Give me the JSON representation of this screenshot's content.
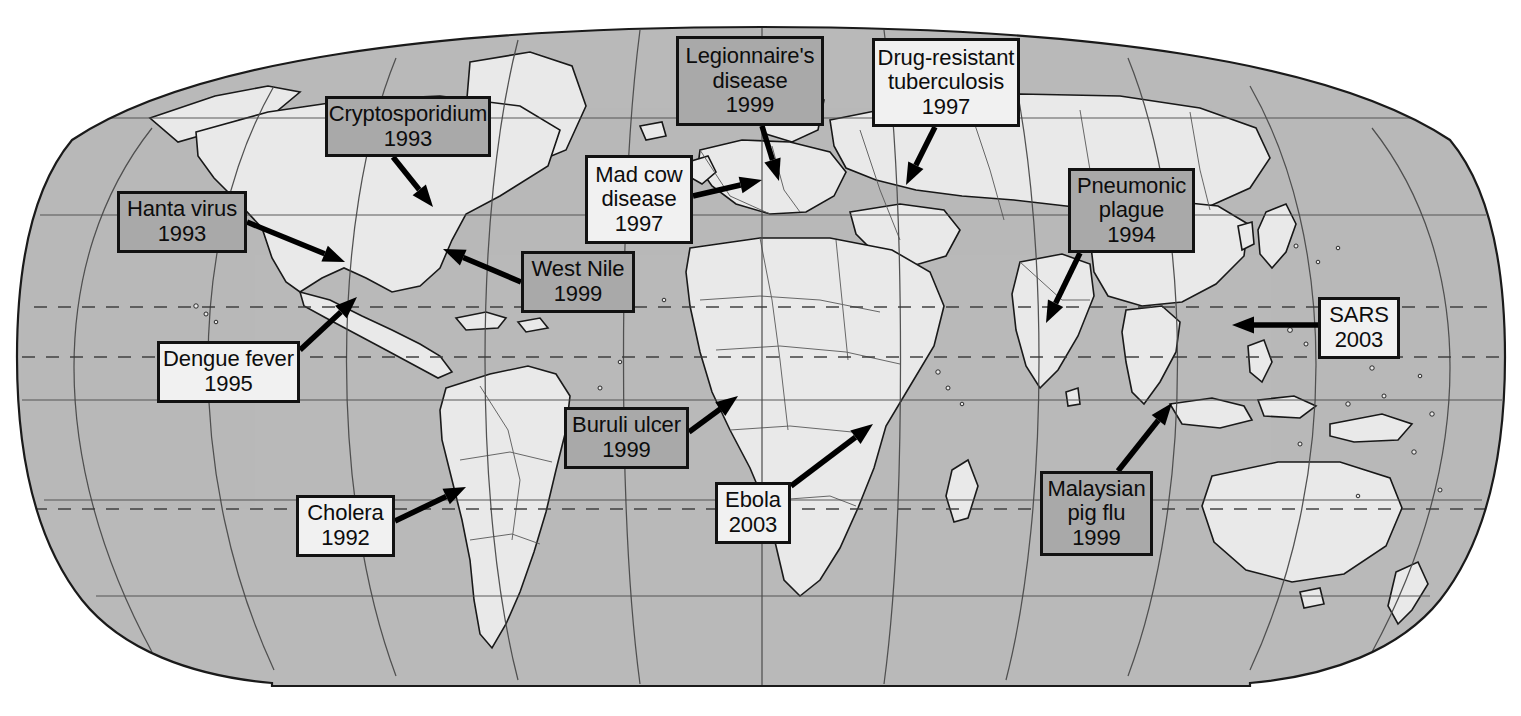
{
  "figure": {
    "kind": "world-map",
    "projection": "robinson-elliptical"
  },
  "colors": {
    "ocean": "#b9b9b9",
    "land": "#e9e9e9",
    "graticule": "#4a4a4a",
    "coastline": "#1a1a1a",
    "border": "#3a3a3a",
    "label_shaded": "#a9a9a9",
    "label_plain": "#f1f1f1",
    "label_outline": "#121212",
    "arrow": "#000000",
    "page_background": "#ffffff"
  },
  "map_frame": {
    "left": 20,
    "top": 27,
    "right": 1505,
    "bottom": 686,
    "dashed_latitudes": [
      "Tropic of Cancer",
      "Equator",
      "Tropic of Capricorn"
    ]
  },
  "labels": [
    {
      "id": "hanta-virus",
      "name": "Hanta virus",
      "year": "1993",
      "style": "shaded",
      "box": {
        "x": 117,
        "y": 191,
        "w": 130,
        "h": 62,
        "font": 22
      },
      "arrow": {
        "x1": 247,
        "y1": 222,
        "x2": 345,
        "y2": 262
      }
    },
    {
      "id": "cryptosporidium",
      "name": "Cryptosporidium",
      "year": "1993",
      "style": "shaded",
      "box": {
        "x": 325,
        "y": 96,
        "w": 166,
        "h": 61,
        "font": 22
      },
      "arrow": {
        "x1": 393,
        "y1": 157,
        "x2": 433,
        "y2": 207
      }
    },
    {
      "id": "dengue-fever",
      "name": "Dengue fever",
      "year": "1995",
      "style": "plain",
      "box": {
        "x": 157,
        "y": 341,
        "w": 143,
        "h": 62,
        "font": 22
      },
      "arrow": {
        "x1": 300,
        "y1": 350,
        "x2": 357,
        "y2": 297
      }
    },
    {
      "id": "west-nile",
      "name": "West Nile",
      "year": "1999",
      "style": "shaded",
      "box": {
        "x": 521,
        "y": 251,
        "w": 114,
        "h": 62,
        "font": 22
      },
      "arrow": {
        "x1": 521,
        "y1": 282,
        "x2": 443,
        "y2": 249
      }
    },
    {
      "id": "cholera",
      "name": "Cholera",
      "year": "1992",
      "style": "plain",
      "box": {
        "x": 296,
        "y": 495,
        "w": 99,
        "h": 62,
        "font": 22
      },
      "arrow": {
        "x1": 395,
        "y1": 521,
        "x2": 466,
        "y2": 487
      }
    },
    {
      "id": "mad-cow-disease",
      "name": "Mad cow disease",
      "year": "1997",
      "style": "plain",
      "box": {
        "x": 585,
        "y": 155,
        "w": 108,
        "h": 89,
        "font": 22
      },
      "arrow": {
        "x1": 693,
        "y1": 196,
        "x2": 762,
        "y2": 180
      }
    },
    {
      "id": "legionnaires-disease",
      "name": "Legionnaire's disease",
      "year": "1999",
      "style": "shaded",
      "box": {
        "x": 676,
        "y": 36,
        "w": 148,
        "h": 90,
        "font": 22
      },
      "arrow": {
        "x1": 762,
        "y1": 126,
        "x2": 779,
        "y2": 181
      }
    },
    {
      "id": "drug-resistant-tuberculosis",
      "name": "Drug-resistant tuberculosis",
      "year": "1997",
      "style": "plain",
      "box": {
        "x": 872,
        "y": 38,
        "w": 148,
        "h": 89,
        "font": 22
      },
      "arrow": {
        "x1": 935,
        "y1": 127,
        "x2": 906,
        "y2": 185
      }
    },
    {
      "id": "buruli-ulcer",
      "name": "Buruli ulcer",
      "year": "1999",
      "style": "shaded",
      "box": {
        "x": 564,
        "y": 407,
        "w": 125,
        "h": 62,
        "font": 22
      },
      "arrow": {
        "x1": 689,
        "y1": 432,
        "x2": 738,
        "y2": 396
      }
    },
    {
      "id": "ebola",
      "name": "Ebola",
      "year": "2003",
      "style": "plain",
      "box": {
        "x": 715,
        "y": 482,
        "w": 76,
        "h": 62,
        "font": 22
      },
      "arrow": {
        "x1": 791,
        "y1": 486,
        "x2": 873,
        "y2": 424
      }
    },
    {
      "id": "pneumonic-plague",
      "name": "Pneumonic plague",
      "year": "1994",
      "style": "shaded",
      "box": {
        "x": 1068,
        "y": 168,
        "w": 127,
        "h": 85,
        "font": 22
      },
      "arrow": {
        "x1": 1080,
        "y1": 253,
        "x2": 1046,
        "y2": 323
      }
    },
    {
      "id": "sars",
      "name": "SARS",
      "year": "2003",
      "style": "plain",
      "box": {
        "x": 1318,
        "y": 297,
        "w": 82,
        "h": 62,
        "font": 22
      },
      "arrow": {
        "x1": 1318,
        "y1": 325,
        "x2": 1232,
        "y2": 325
      }
    },
    {
      "id": "malaysian-pig-flu",
      "name": "Malaysian pig flu",
      "year": "1999",
      "style": "shaded",
      "box": {
        "x": 1040,
        "y": 471,
        "w": 113,
        "h": 85,
        "font": 22
      },
      "arrow": {
        "x1": 1118,
        "y1": 471,
        "x2": 1172,
        "y2": 403
      }
    }
  ]
}
